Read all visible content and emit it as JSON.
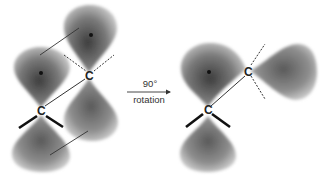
{
  "diagram": {
    "left_structure": {
      "atoms": [
        {
          "id": "C1",
          "label": "C"
        },
        {
          "id": "C2",
          "label": "C"
        }
      ],
      "description": "Parallel p orbitals (overlapping, pi bond)"
    },
    "arrow": {
      "angle_label": "90°",
      "action_label": "rotation"
    },
    "right_structure": {
      "atoms": [
        {
          "id": "C1",
          "label": "C"
        },
        {
          "id": "C2",
          "label": "C"
        }
      ],
      "description": "Perpendicular p orbitals (no overlap)"
    },
    "colors": {
      "lobe_dark": "#4a4a4a",
      "lobe_mid": "#8a8a8a",
      "lobe_light": "#d8d8d8",
      "bond": "#222222",
      "background": "#ffffff"
    }
  }
}
